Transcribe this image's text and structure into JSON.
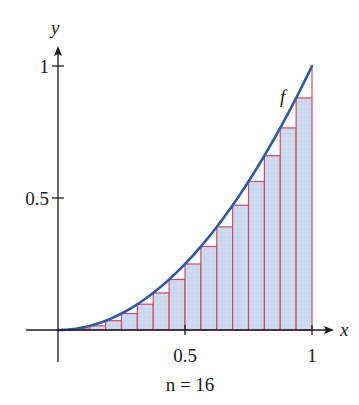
{
  "chart_data": {
    "type": "area",
    "subtype": "left-endpoint Riemann sum",
    "title": "",
    "function_label": "f",
    "function_expression": "x^2",
    "n_label": "n = 16",
    "n": 16,
    "xlabel": "x",
    "ylabel": "y",
    "xlim": [
      0,
      1
    ],
    "ylim": [
      0,
      1
    ],
    "x_ticks": [
      {
        "value": 0.5,
        "label": "0.5"
      },
      {
        "value": 1,
        "label": "1"
      }
    ],
    "y_ticks": [
      {
        "value": 0.5,
        "label": "0.5"
      },
      {
        "value": 1,
        "label": "1"
      }
    ],
    "grid": false,
    "rectangles": {
      "x_left": [
        0,
        0.0625,
        0.125,
        0.1875,
        0.25,
        0.3125,
        0.375,
        0.4375,
        0.5,
        0.5625,
        0.625,
        0.6875,
        0.75,
        0.8125,
        0.875,
        0.9375
      ],
      "width": 0.0625,
      "heights": [
        0,
        0.0039,
        0.0156,
        0.0352,
        0.0625,
        0.0977,
        0.1406,
        0.1914,
        0.25,
        0.3164,
        0.3906,
        0.4727,
        0.5625,
        0.6602,
        0.7656,
        0.8789
      ]
    },
    "colors": {
      "curve": "#2c5aa8",
      "rect_edge": "#d9485c",
      "rect_fill": "#cbdaf0",
      "axes": "#1a1a1a"
    }
  }
}
